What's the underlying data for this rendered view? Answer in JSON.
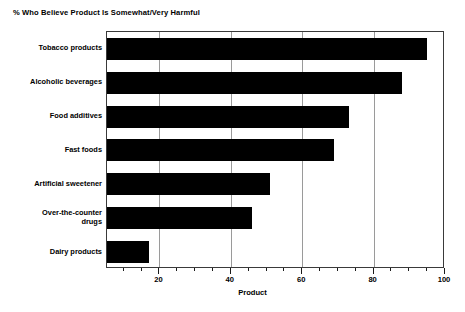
{
  "chart_data": {
    "type": "bar",
    "orientation": "horizontal",
    "title": "% Who Believe Product Is Somewhat/Very Harmful",
    "xlabel": "Product",
    "ylabel": "",
    "categories": [
      "Tobacco products",
      "Alcoholic beverages",
      "Food additives",
      "Fast foods",
      "Artificial sweetener",
      "Over-the-counter\ndrugs",
      "Dairy products"
    ],
    "values": [
      95,
      88,
      73,
      69,
      51,
      46,
      17
    ],
    "xlim": [
      5.3,
      100
    ],
    "xticks": [
      20,
      40,
      60,
      80,
      100
    ],
    "xtick_labels": [
      "20",
      "40",
      "60",
      "80",
      "100"
    ],
    "xminor_ticks": [
      10,
      15,
      25,
      30,
      35,
      45,
      50,
      55,
      65,
      70,
      75,
      85,
      90,
      95
    ],
    "grid": "vertical",
    "bar_color": "#000000",
    "grid_color": "#9a9a9a",
    "axis_color": "#3a3a3a"
  }
}
